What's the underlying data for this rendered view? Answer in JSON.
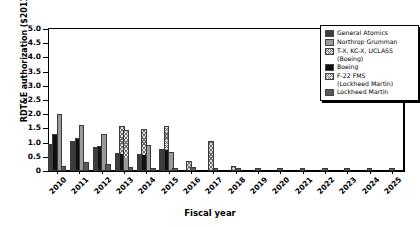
{
  "chart_data": {
    "type": "bar",
    "title": "",
    "subtitle": "",
    "xlabel": "Fiscal year",
    "ylabel": "RDT&E authorization ($2011B)",
    "ylim": [
      0,
      5.0
    ],
    "ytick_values": [
      "0",
      "0.5",
      "1.0",
      "1.5",
      "2.0",
      "2.5",
      "3.0",
      "3.5",
      "4.0",
      "4.5",
      "5.0"
    ],
    "grid": false,
    "legend_position": "top-right",
    "stacked": true,
    "categories": [
      "2010",
      "2011",
      "2012",
      "2013",
      "2014",
      "2015",
      "2016",
      "2017",
      "2018",
      "2019",
      "2020",
      "2021",
      "2022",
      "2023",
      "2024",
      "2025"
    ],
    "series": [
      {
        "name": "General Atomics",
        "color": "#3d3d3d",
        "pattern": "solid",
        "values": [
          0.88,
          1.0,
          0.76,
          0.55,
          0.52,
          0.71,
          0.0,
          0.0,
          0.0,
          0.0,
          0.0,
          0.0,
          0.0,
          0.0,
          0.0,
          0.0
        ]
      },
      {
        "name": "Northrop Grumman",
        "color": "#9a9a9a",
        "pattern": "solid",
        "values": [
          1.95,
          1.55,
          1.25,
          1.37,
          0.85,
          0.6,
          0.0,
          0.1,
          0.0,
          0.0,
          0.0,
          0.0,
          0.0,
          0.0,
          0.0,
          0.0
        ]
      },
      {
        "name": "T-X, KC-X, UCLASS\n(Boeing)",
        "color": "#dcdcdc",
        "pattern": "crosshatch",
        "values": [
          0.0,
          0.0,
          0.0,
          0.46,
          0.9,
          0.78,
          0.27,
          1.0,
          0.0,
          0.0,
          0.0,
          0.0,
          0.0,
          0.0,
          0.0,
          0.0
        ]
      },
      {
        "name": "Boeing",
        "color": "#101010",
        "pattern": "solid",
        "values": [
          1.22,
          1.1,
          0.8,
          0.0,
          0.0,
          0.0,
          0.0,
          0.0,
          0.0,
          0.0,
          0.0,
          0.0,
          0.0,
          0.0,
          0.0,
          0.0
        ]
      },
      {
        "name": "F-22 FMS\n(Lockheed Martin)",
        "color": "#e2e2e2",
        "pattern": "crosshatch",
        "values": [
          0.0,
          0.0,
          0.0,
          0.95,
          0.9,
          0.8,
          0.0,
          0.0,
          0.0,
          0.0,
          0.0,
          0.0,
          0.0,
          0.0,
          0.0,
          0.0
        ]
      },
      {
        "name": "Lockheed Martin",
        "color": "#5a5a5a",
        "pattern": "solid",
        "values": [
          0.09,
          0.25,
          0.16,
          0.07,
          0.05,
          0.03,
          0.07,
          0.03,
          0.03,
          0.02,
          0.02,
          0.02,
          0.02,
          0.02,
          0.02,
          0.02
        ]
      }
    ],
    "groups": [
      {
        "year": "2010",
        "bars": [
          {
            "series": "General Atomics",
            "segments": [
              {
                "fill": "f-ga",
                "value": 0.88
              }
            ]
          },
          {
            "series": "Boeing",
            "segments": [
              {
                "fill": "f-boeing",
                "value": 1.22
              }
            ]
          },
          {
            "series": "Northrop Grumman",
            "segments": [
              {
                "fill": "f-ng",
                "value": 1.95
              }
            ]
          },
          {
            "series": "Lockheed Martin",
            "segments": [
              {
                "fill": "f-lm",
                "value": 0.09
              }
            ]
          }
        ]
      },
      {
        "year": "2011",
        "bars": [
          {
            "series": "General Atomics",
            "segments": [
              {
                "fill": "f-ga",
                "value": 1.0
              }
            ]
          },
          {
            "series": "Boeing",
            "segments": [
              {
                "fill": "f-boeing",
                "value": 1.1
              }
            ]
          },
          {
            "series": "Northrop Grumman",
            "segments": [
              {
                "fill": "f-ng",
                "value": 1.55
              }
            ]
          },
          {
            "series": "Lockheed Martin",
            "segments": [
              {
                "fill": "f-lm",
                "value": 0.25
              }
            ]
          }
        ]
      },
      {
        "year": "2012",
        "bars": [
          {
            "series": "General Atomics",
            "segments": [
              {
                "fill": "f-ga",
                "value": 0.76
              }
            ]
          },
          {
            "series": "Boeing",
            "segments": [
              {
                "fill": "f-boeing",
                "value": 0.8
              }
            ]
          },
          {
            "series": "Northrop Grumman",
            "segments": [
              {
                "fill": "f-ng",
                "value": 1.25
              }
            ]
          },
          {
            "series": "Lockheed Martin",
            "segments": [
              {
                "fill": "f-lm",
                "value": 0.16
              }
            ]
          }
        ]
      },
      {
        "year": "2013",
        "bars": [
          {
            "series": "General Atomics",
            "segments": [
              {
                "fill": "f-ga",
                "value": 0.55
              }
            ]
          },
          {
            "series": "Boeing + T-X stack",
            "segments": [
              {
                "fill": "f-boeing",
                "value": 0.55
              },
              {
                "fill": "f-hatch-b",
                "value": 0.95
              }
            ]
          },
          {
            "series": "Northrop Grumman + F-22 FMS",
            "segments": [
              {
                "fill": "f-ng",
                "value": 0.42
              },
              {
                "fill": "f-hatch-f22",
                "value": 0.95
              }
            ]
          },
          {
            "series": "Lockheed Martin",
            "segments": [
              {
                "fill": "f-lm",
                "value": 0.07
              }
            ]
          }
        ]
      },
      {
        "year": "2014",
        "bars": [
          {
            "series": "General Atomics",
            "segments": [
              {
                "fill": "f-ga",
                "value": 0.52
              }
            ]
          },
          {
            "series": "Boeing + T-X stack",
            "segments": [
              {
                "fill": "f-boeing",
                "value": 0.52
              },
              {
                "fill": "f-hatch-b",
                "value": 0.9
              }
            ]
          },
          {
            "series": "Northrop Grumman",
            "segments": [
              {
                "fill": "f-ng",
                "value": 0.85
              }
            ]
          },
          {
            "series": "Lockheed Martin",
            "segments": [
              {
                "fill": "f-lm",
                "value": 0.05
              }
            ]
          }
        ]
      },
      {
        "year": "2015",
        "bars": [
          {
            "series": "General Atomics",
            "segments": [
              {
                "fill": "f-ga",
                "value": 0.71
              }
            ]
          },
          {
            "series": "Boeing + T-X stack",
            "segments": [
              {
                "fill": "f-boeing",
                "value": 0.7
              },
              {
                "fill": "f-hatch-b",
                "value": 0.8
              }
            ]
          },
          {
            "series": "Northrop Grumman",
            "segments": [
              {
                "fill": "f-ng",
                "value": 0.6
              }
            ]
          },
          {
            "series": "Lockheed Martin",
            "segments": [
              {
                "fill": "f-lm",
                "value": 0.03
              }
            ]
          }
        ]
      },
      {
        "year": "2016",
        "bars": [
          {
            "series": "T-X, KC-X, UCLASS (Boeing)",
            "segments": [
              {
                "fill": "f-hatch-b",
                "value": 0.27
              }
            ]
          },
          {
            "series": "Lockheed Martin",
            "segments": [
              {
                "fill": "f-lm",
                "value": 0.07
              }
            ]
          }
        ]
      },
      {
        "year": "2017",
        "bars": [
          {
            "series": "T-X, KC-X, UCLASS (Boeing)",
            "segments": [
              {
                "fill": "f-hatch-b",
                "value": 1.0
              }
            ]
          },
          {
            "series": "Lockheed Martin",
            "segments": [
              {
                "fill": "f-lm",
                "value": 0.03
              }
            ]
          }
        ]
      },
      {
        "year": "2018",
        "bars": [
          {
            "series": "T-X, KC-X, UCLASS (Boeing)",
            "segments": [
              {
                "fill": "f-hatch-b",
                "value": 0.1
              }
            ]
          },
          {
            "series": "Lockheed Martin",
            "segments": [
              {
                "fill": "f-lm",
                "value": 0.03
              }
            ]
          }
        ]
      },
      {
        "year": "2019",
        "bars": [
          {
            "series": "Lockheed Martin",
            "segments": [
              {
                "fill": "f-lm",
                "value": 0.02
              }
            ]
          }
        ]
      },
      {
        "year": "2020",
        "bars": [
          {
            "series": "Lockheed Martin",
            "segments": [
              {
                "fill": "f-lm",
                "value": 0.02
              }
            ]
          }
        ]
      },
      {
        "year": "2021",
        "bars": [
          {
            "series": "Lockheed Martin",
            "segments": [
              {
                "fill": "f-lm",
                "value": 0.02
              }
            ]
          }
        ]
      },
      {
        "year": "2022",
        "bars": [
          {
            "series": "Lockheed Martin",
            "segments": [
              {
                "fill": "f-lm",
                "value": 0.02
              }
            ]
          }
        ]
      },
      {
        "year": "2023",
        "bars": [
          {
            "series": "Lockheed Martin",
            "segments": [
              {
                "fill": "f-lm",
                "value": 0.02
              }
            ]
          }
        ]
      },
      {
        "year": "2024",
        "bars": [
          {
            "series": "Lockheed Martin",
            "segments": [
              {
                "fill": "f-lm",
                "value": 0.02
              }
            ]
          }
        ]
      },
      {
        "year": "2025",
        "bars": [
          {
            "series": "Lockheed Martin",
            "segments": [
              {
                "fill": "f-lm",
                "value": 0.02
              }
            ]
          }
        ]
      }
    ]
  },
  "legend": {
    "items": [
      {
        "label": "General Atomics",
        "swatch": "f-ga"
      },
      {
        "label": "Northrop Grumman",
        "swatch": "f-ng"
      },
      {
        "label": "T-X, KC-X, UCLASS\n(Boeing)",
        "swatch": "f-hatch-b"
      },
      {
        "label": "Boeing",
        "swatch": "f-boeing"
      },
      {
        "label": "F-22 FMS\n(Lockheed Martin)",
        "swatch": "f-hatch-f22"
      },
      {
        "label": "Lockheed Martin",
        "swatch": "f-lm"
      }
    ]
  }
}
